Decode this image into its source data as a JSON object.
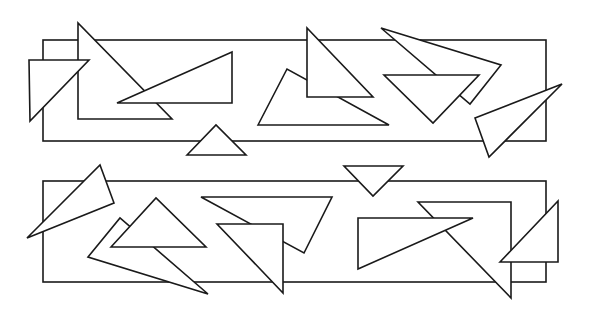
{
  "canvas": {
    "width": 589,
    "height": 336,
    "background": "#ffffff",
    "stroke": "#1a1a1a"
  },
  "panels": [
    {
      "name": "top-panel",
      "rect": {
        "x": 43,
        "y": 40,
        "w": 503,
        "h": 101
      },
      "triangles_behind": [
        {
          "name": "tall-right-triangle",
          "points": "78,23 78,119 172,119"
        },
        {
          "name": "long-flat-triangle",
          "points": "117,103 232,52 232,103"
        },
        {
          "name": "wide-triangle-center",
          "points": "258,125 287,69 389,125"
        },
        {
          "name": "right-angle-triangle-center",
          "points": "307,28 307,97 373,97"
        },
        {
          "name": "long-skinny-triangle",
          "points": "381,28 501,65 470,104"
        },
        {
          "name": "inverted-triangle",
          "points": "384,75 479,75 433,123"
        },
        {
          "name": "right-edge-triangle",
          "points": "475,118 562,84 489,157"
        },
        {
          "name": "small-upward-triangle",
          "points": "187,155 216,125 246,155"
        },
        {
          "name": "left-corner-triangle",
          "points": "29,60 89,60 30,121"
        }
      ]
    },
    {
      "name": "bottom-panel",
      "rect": {
        "x": 43,
        "y": 181,
        "w": 503,
        "h": 101
      },
      "triangles_behind": [
        {
          "name": "left-spike-triangle",
          "points": "27,238 100,165 114,203"
        },
        {
          "name": "long-bottom-left-triangle",
          "points": "88,257 120,218 208,294"
        },
        {
          "name": "upward-triangle",
          "points": "111,247 156,198 206,247"
        },
        {
          "name": "wide-sloped-triangle",
          "points": "201,197 332,197 304,253"
        },
        {
          "name": "right-angle-triangle-left",
          "points": "217,224 283,224 283,293"
        },
        {
          "name": "small-inverted-triangle",
          "points": "344,166 403,166 373,196"
        },
        {
          "name": "tall-right-triangle-right",
          "points": "418,202 511,202 511,298"
        },
        {
          "name": "long-flat-triangle-right",
          "points": "358,218 473,218 358,269"
        },
        {
          "name": "right-edge-triangle",
          "points": "500,262 558,201 558,262"
        }
      ]
    }
  ]
}
